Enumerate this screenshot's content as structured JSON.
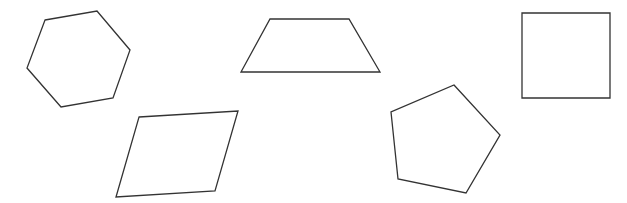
{
  "canvas": {
    "width": 627,
    "height": 203,
    "background": "#ffffff"
  },
  "style": {
    "stroke": "#333333",
    "stroke_width": 1.3
  },
  "shapes": [
    {
      "name": "hexagon",
      "sides": 6,
      "points": "45,20 97,11 130,50 113,98 61,107 27,68"
    },
    {
      "name": "trapezoid",
      "sides": 4,
      "points": "270,19 349,19 380,72 241,72"
    },
    {
      "name": "square",
      "sides": 4,
      "points": "522,13 610,13 610,98 522,98"
    },
    {
      "name": "parallelogram",
      "sides": 4,
      "points": "139,117 238,111 215,191 116,197"
    },
    {
      "name": "pentagon",
      "sides": 5,
      "points": "454,85 500,135 466,193 398,179 391,112"
    }
  ]
}
